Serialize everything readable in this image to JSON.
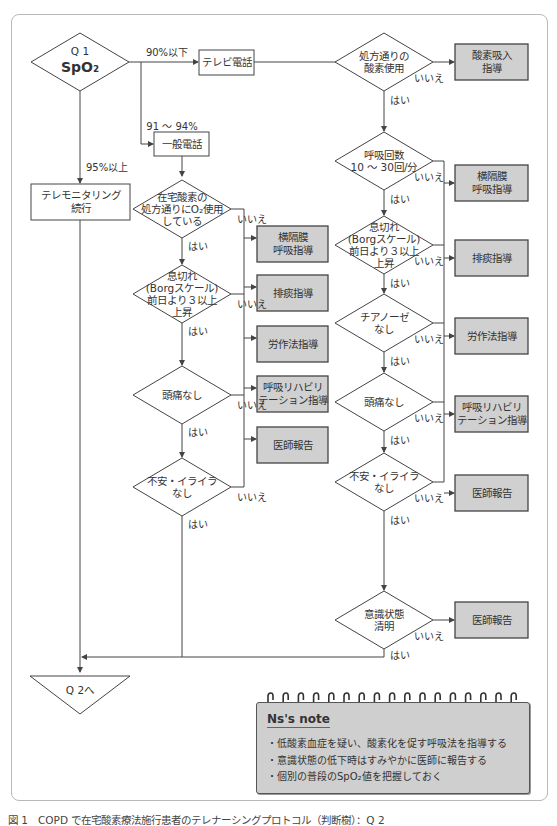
{
  "figure": {
    "caption": "図 1　COPD で在宅酸素療法施行患者のテレナーシングプロトコル（判断樹）：Q 2"
  },
  "colors": {
    "line": "#444444",
    "action_fill": "#d0d0d0",
    "note_fill": "#cfcfcf",
    "frame_border": "#b8b8b8"
  },
  "start": {
    "id": "Q1",
    "line1": "Q 1",
    "line2": "SpO₂"
  },
  "branches": {
    "low": "90%以下",
    "mid": "91 ～ 94%",
    "high": "95%以上"
  },
  "nodes": {
    "tv_call": "テレビ電話",
    "general_call": "一般電話",
    "telemonitoring": [
      "テレモニタリング",
      "続行"
    ],
    "end": "Q 2へ"
  },
  "left_column": {
    "decisions": [
      {
        "id": "home-oxygen",
        "lines": [
          "在宅酸素の",
          "処方通りにO₂使用",
          "している"
        ]
      },
      {
        "id": "dyspnea",
        "lines": [
          "息切れ",
          "(Borgスケール)",
          "前日より３以上",
          "上昇"
        ]
      },
      {
        "id": "headache",
        "lines": [
          "頭痛なし"
        ]
      },
      {
        "id": "anxiety",
        "lines": [
          "不安・イライラ",
          "なし"
        ]
      }
    ],
    "actions": [
      {
        "id": "diaphragm",
        "lines": [
          "横隔膜",
          "呼吸指導"
        ]
      },
      {
        "id": "sputum",
        "lines": [
          "排痰指導"
        ]
      },
      {
        "id": "exertion",
        "lines": [
          "労作法指導"
        ]
      },
      {
        "id": "rehab",
        "lines": [
          "呼吸リハビリ",
          "テーション指導"
        ]
      },
      {
        "id": "doctor",
        "lines": [
          "医師報告"
        ]
      }
    ]
  },
  "right_column": {
    "decisions": [
      {
        "id": "oxygen-use",
        "lines": [
          "処方通りの",
          "酸素使用"
        ]
      },
      {
        "id": "resp-rate",
        "lines": [
          "呼吸回数",
          "10 ～ 30回/分"
        ]
      },
      {
        "id": "dyspnea",
        "lines": [
          "息切れ",
          "(Borgスケール)",
          "前日より３以上",
          "上昇"
        ]
      },
      {
        "id": "cyanosis",
        "lines": [
          "チアノーゼ",
          "なし"
        ]
      },
      {
        "id": "headache",
        "lines": [
          "頭痛なし"
        ]
      },
      {
        "id": "anxiety",
        "lines": [
          "不安・イライラ",
          "なし"
        ]
      },
      {
        "id": "consciousness",
        "lines": [
          "意識状態",
          "清明"
        ]
      }
    ],
    "actions": [
      {
        "id": "oxygen-inhalation",
        "lines": [
          "酸素吸入",
          "指導"
        ]
      },
      {
        "id": "diaphragm",
        "lines": [
          "横隔膜",
          "呼吸指導"
        ]
      },
      {
        "id": "sputum",
        "lines": [
          "排痰指導"
        ]
      },
      {
        "id": "exertion",
        "lines": [
          "労作法指導"
        ]
      },
      {
        "id": "rehab",
        "lines": [
          "呼吸リハビリ",
          "テーション指導"
        ]
      },
      {
        "id": "doctor",
        "lines": [
          "医師報告"
        ]
      },
      {
        "id": "doctor2",
        "lines": [
          "医師報告"
        ]
      }
    ]
  },
  "edge_labels": {
    "yes": "はい",
    "no": "いいえ"
  },
  "note": {
    "title": "Ns's note",
    "items": [
      "・低酸素血症を疑い、酸素化を促す呼吸法を指導する",
      "・意識状態の低下時はすみやかに医師に報告する",
      "・個別の普段のSpO₂値を把握しておく"
    ]
  }
}
